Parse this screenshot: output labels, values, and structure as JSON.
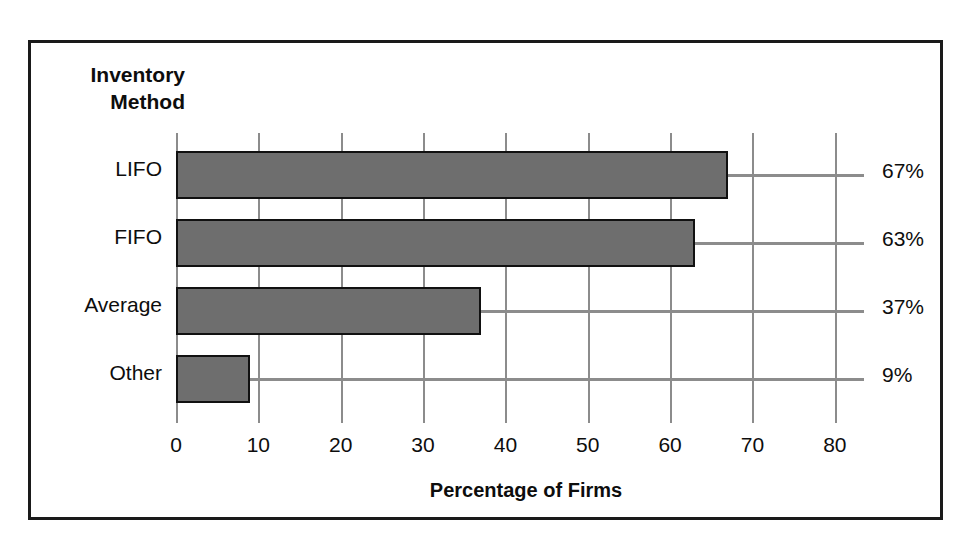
{
  "chart_data": {
    "type": "bar",
    "orientation": "horizontal",
    "title": "",
    "category_axis_title": "Inventory\nMethod",
    "xlabel": "Percentage of Firms",
    "ylabel": "",
    "categories": [
      "LIFO",
      "FIFO",
      "Average",
      "Other"
    ],
    "values": [
      67,
      63,
      37,
      9
    ],
    "value_labels": [
      "67%",
      "63%",
      "37%",
      "9%"
    ],
    "xlim": [
      0,
      85
    ],
    "xticks": [
      0,
      10,
      20,
      30,
      40,
      50,
      60,
      70,
      80
    ],
    "xtick_labels": [
      "0",
      "10",
      "20",
      "30",
      "40",
      "50",
      "60",
      "70",
      "80"
    ],
    "grid": "vertical",
    "legend": "none",
    "bar_color": "#6e6e6e",
    "bar_border_color": "#111111",
    "gridline_color": "#8c8c8c",
    "leader_line_color": "#8c8c8c",
    "frame_color": "#1a1a1a",
    "background_color": "#ffffff"
  }
}
